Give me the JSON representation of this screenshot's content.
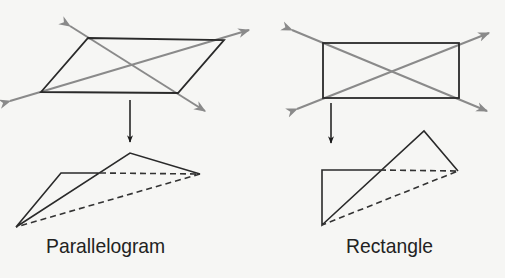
{
  "figures": [
    {
      "name": "parallelogram",
      "label": "Parallelogram"
    },
    {
      "name": "rectangle",
      "label": "Rectangle"
    }
  ],
  "colors": {
    "outline": "#2a2a2a",
    "diagonal": "#8a8a8a",
    "background": "#f6f6f4"
  }
}
